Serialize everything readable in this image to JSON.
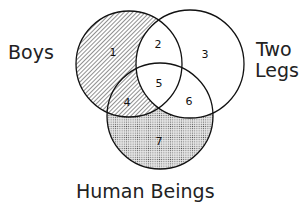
{
  "labels": {
    "boys": "Boys",
    "two_legs_1": "Two",
    "two_legs_2": "Legs",
    "human_beings": "Human Beings"
  },
  "regions": [
    "1",
    "2",
    "3",
    "4",
    "5",
    "6",
    "7"
  ],
  "sets": [
    {
      "name": "Boys",
      "cx": 129,
      "cy": 64,
      "r": 53
    },
    {
      "name": "Two Legs",
      "cx": 190,
      "cy": 64,
      "r": 54
    },
    {
      "name": "Human Beings",
      "cx": 160,
      "cy": 116,
      "r": 53
    }
  ],
  "colors": {
    "stroke": "#111111",
    "hatch": "#333333",
    "dots": "#555555"
  }
}
